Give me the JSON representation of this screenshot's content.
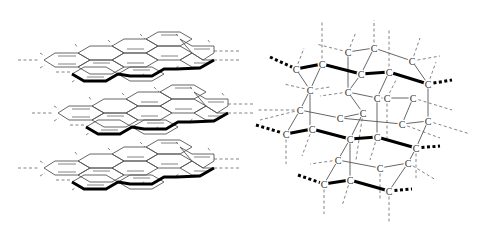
{
  "figure": {
    "left_panel": {
      "name": "graphite",
      "description": "Three stacked graphene sheets (planar hexagonal carbon layers) shown in perspective",
      "sheets": [
        {
          "index": 0,
          "offset_y": 0
        },
        {
          "index": 1,
          "offset_y": 53
        },
        {
          "index": 2,
          "offset_y": 108
        }
      ]
    },
    "right_panel": {
      "name": "diamond",
      "description": "Tetrahedral 3D carbon network with labeled atoms",
      "atom_label": "C",
      "atoms": [
        {
          "x": 348,
          "y": 52
        },
        {
          "x": 374,
          "y": 48
        },
        {
          "x": 412,
          "y": 61
        },
        {
          "x": 296,
          "y": 69
        },
        {
          "x": 322,
          "y": 64
        },
        {
          "x": 361,
          "y": 74
        },
        {
          "x": 389,
          "y": 72
        },
        {
          "x": 428,
          "y": 84
        },
        {
          "x": 310,
          "y": 90
        },
        {
          "x": 348,
          "y": 92
        },
        {
          "x": 377,
          "y": 98
        },
        {
          "x": 387,
          "y": 98
        },
        {
          "x": 413,
          "y": 98
        },
        {
          "x": 300,
          "y": 110
        },
        {
          "x": 340,
          "y": 118
        },
        {
          "x": 363,
          "y": 113
        },
        {
          "x": 402,
          "y": 124
        },
        {
          "x": 428,
          "y": 121
        },
        {
          "x": 286,
          "y": 134
        },
        {
          "x": 312,
          "y": 129
        },
        {
          "x": 350,
          "y": 139
        },
        {
          "x": 377,
          "y": 137
        },
        {
          "x": 416,
          "y": 148
        },
        {
          "x": 338,
          "y": 160
        },
        {
          "x": 380,
          "y": 168
        },
        {
          "x": 408,
          "y": 163
        },
        {
          "x": 324,
          "y": 184
        },
        {
          "x": 350,
          "y": 180
        },
        {
          "x": 389,
          "y": 191
        }
      ]
    },
    "colors": {
      "bond_thin": "#555555",
      "bond_bold": "#000000",
      "dashed_bond": "#666666",
      "background": "#ffffff"
    }
  }
}
